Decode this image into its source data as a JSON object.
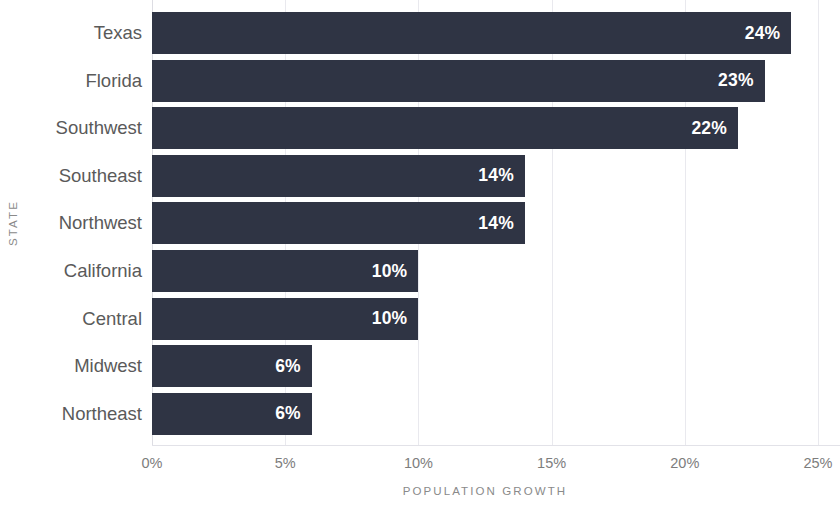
{
  "chart_data": {
    "type": "bar",
    "orientation": "horizontal",
    "title": "",
    "xlabel": "POPULATION GROWTH",
    "ylabel": "STATE",
    "categories": [
      "Texas",
      "Florida",
      "Southwest",
      "Southeast",
      "Northwest",
      "California",
      "Central",
      "Midwest",
      "Northeast"
    ],
    "values": [
      24,
      23,
      22,
      14,
      14,
      10,
      10,
      6,
      6
    ],
    "value_labels": [
      "24%",
      "23%",
      "22%",
      "14%",
      "14%",
      "10%",
      "10%",
      "6%",
      "6%"
    ],
    "xlim": [
      0,
      25
    ],
    "x_ticks": [
      0,
      5,
      10,
      15,
      20,
      25
    ],
    "x_tick_labels": [
      "0%",
      "5%",
      "10%",
      "15%",
      "20%",
      "25%"
    ],
    "grid": true,
    "grid_axis": "x",
    "legend": false,
    "bar_color": "#2f3444",
    "value_label_color": "#ffffff",
    "gridline_color": "#e9e9ee",
    "tick_label_color": "#7d7d7d",
    "category_label_color": "#5a5a5a",
    "axis_title_color": "#8a8a8a",
    "background_color": "#ffffff"
  }
}
